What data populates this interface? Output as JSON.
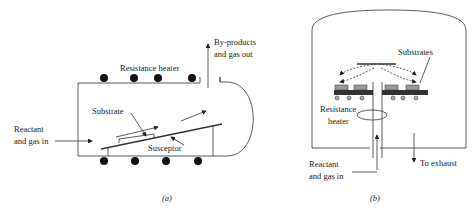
{
  "figure_a": {
    "labels": {
      "heater": "Resistance heater",
      "outlet_line1": "By-products",
      "outlet_line2": "and gas out",
      "substrate": "Substrate",
      "inlet_line1": "Reactant",
      "inlet_line2": "and gas in",
      "susceptor": "Susceptor"
    },
    "caption": "(a)"
  },
  "figure_b": {
    "labels": {
      "substrates": "Substrates",
      "heater_line1": "Resistance",
      "heater_line2": "heater",
      "inlet_line1": "Reactant",
      "inlet_line2": "and gas in",
      "exhaust": "To exhaust"
    },
    "caption": "(b)"
  },
  "colors": {
    "line": "#333333",
    "heater_dot": "#111111",
    "substrate_fill": "#9a9a9a",
    "susceptor_fill": "#333333"
  }
}
